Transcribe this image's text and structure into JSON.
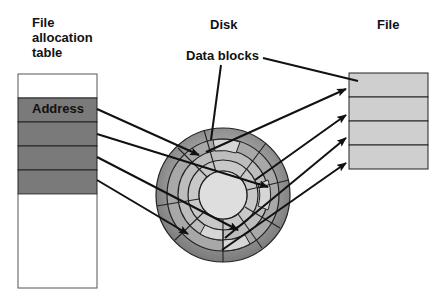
{
  "labels": {
    "fat_title": "File allocation table",
    "disk_title": "Disk",
    "data_blocks": "Data blocks",
    "file_title": "File",
    "address": "Address"
  },
  "colors": {
    "table_white": "#ffffff",
    "table_gray": "#7a7a7a",
    "file_gray": "#cfcfcf",
    "disk_outer": "#8c8c8c",
    "disk_mid": "#a8a8a8",
    "disk_light": "#c8c8c8",
    "disk_hub": "#dedede",
    "line": "#111111"
  },
  "fat": {
    "rows": [
      "",
      "Address",
      "",
      "",
      "",
      ""
    ]
  },
  "file": {
    "blocks": 4
  }
}
